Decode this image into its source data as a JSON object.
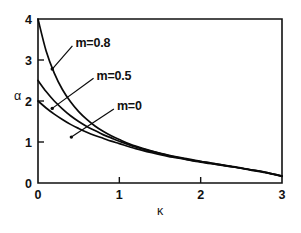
{
  "chart_data": {
    "type": "line",
    "title": "",
    "subtitle": "",
    "xlabel": "κ",
    "ylabel": "α",
    "xlim": [
      0,
      3
    ],
    "ylim": [
      0,
      4
    ],
    "xticks": [
      0,
      1,
      2,
      3
    ],
    "yticks": [
      0,
      1,
      2,
      3,
      4
    ],
    "xtick_labels": [
      "0",
      "1",
      "2",
      "3"
    ],
    "ytick_labels": [
      "0",
      "1",
      "2",
      "3",
      "4"
    ],
    "grid": false,
    "legend_position": "inline-annotations",
    "frame": "box",
    "x": [
      0,
      0.1,
      0.2,
      0.3,
      0.4,
      0.5,
      0.6,
      0.7,
      0.8,
      0.9,
      1.0,
      1.2,
      1.4,
      1.6,
      1.8,
      2.0,
      2.2,
      2.4,
      2.6,
      2.8,
      3.0
    ],
    "series": [
      {
        "name": "m=0.8",
        "label": "m=0.8",
        "values": [
          4.0,
          3.22,
          2.68,
          2.28,
          1.98,
          1.74,
          1.55,
          1.39,
          1.26,
          1.15,
          1.06,
          0.9,
          0.78,
          0.68,
          0.6,
          0.53,
          0.46,
          0.4,
          0.33,
          0.26,
          0.17
        ]
      },
      {
        "name": "m=0.5",
        "label": "m=0.5",
        "values": [
          2.5,
          2.23,
          2.0,
          1.81,
          1.64,
          1.5,
          1.38,
          1.28,
          1.18,
          1.1,
          1.02,
          0.88,
          0.77,
          0.67,
          0.59,
          0.52,
          0.46,
          0.39,
          0.33,
          0.26,
          0.17
        ]
      },
      {
        "name": "m=0",
        "label": "m=0",
        "values": [
          2.0,
          1.83,
          1.68,
          1.55,
          1.43,
          1.33,
          1.24,
          1.16,
          1.09,
          1.02,
          0.96,
          0.84,
          0.74,
          0.65,
          0.58,
          0.51,
          0.45,
          0.39,
          0.32,
          0.25,
          0.16
        ]
      }
    ],
    "annotations": [
      {
        "text": "m=0.8",
        "label_x": 0.46,
        "label_y": 3.42,
        "target_x": 0.175,
        "target_y": 2.78
      },
      {
        "text": "m=0.5",
        "label_x": 0.72,
        "label_y": 2.63,
        "target_x": 0.175,
        "target_y": 1.82
      },
      {
        "text": "m=0",
        "label_x": 0.97,
        "label_y": 1.88,
        "target_x": 0.41,
        "target_y": 1.12
      }
    ],
    "colors": {
      "curve": "#0a0a0a",
      "axis": "#111111",
      "background": "#ffffff"
    }
  }
}
